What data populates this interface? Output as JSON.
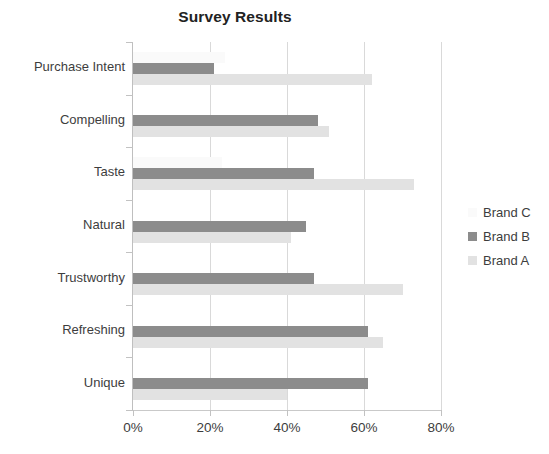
{
  "chart_data": {
    "type": "bar",
    "orientation": "horizontal",
    "title": "Survey Results",
    "xlabel": "",
    "ylabel": "",
    "xlim": [
      0,
      80
    ],
    "xticks": [
      "0%",
      "20%",
      "40%",
      "60%",
      "80%"
    ],
    "xtick_values": [
      0,
      20,
      40,
      60,
      80
    ],
    "grid": true,
    "grid_axis": "x",
    "legend_position": "right",
    "categories": [
      "Purchase Intent",
      "Compelling",
      "Taste",
      "Natural",
      "Trustworthy",
      "Refreshing",
      "Unique"
    ],
    "series": [
      {
        "name": "Brand C",
        "color": "#fafafa",
        "values": [
          24,
          0,
          23,
          0,
          0,
          0,
          0
        ]
      },
      {
        "name": "Brand B",
        "color": "#8c8c8c",
        "values": [
          21,
          48,
          47,
          45,
          47,
          61,
          61
        ]
      },
      {
        "name": "Brand A",
        "color": "#e2e2e2",
        "values": [
          62,
          51,
          73,
          41,
          70,
          65,
          40
        ]
      }
    ]
  },
  "legend": {
    "items": [
      {
        "label": "Brand C",
        "color": "#fafafa"
      },
      {
        "label": "Brand B",
        "color": "#8c8c8c"
      },
      {
        "label": "Brand A",
        "color": "#e2e2e2"
      }
    ]
  }
}
